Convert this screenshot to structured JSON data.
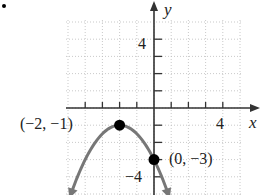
{
  "chart_data": {
    "type": "line",
    "title": "",
    "xlabel": "x",
    "ylabel": "y",
    "xlim": [
      -5,
      5
    ],
    "ylim": [
      -5,
      5
    ],
    "grid": true,
    "grid_style": "dotted",
    "tick_labels": {
      "x": [
        {
          "value": 4,
          "label": "4"
        }
      ],
      "y": [
        {
          "value": 4,
          "label": "4"
        },
        {
          "value": -4,
          "label": "−4"
        }
      ]
    },
    "series": [
      {
        "name": "parabola",
        "equation": "y = -1/2 (x + 2)^2 - 1",
        "color": "#777777",
        "x": [
          -4.8,
          -4,
          -3,
          -2,
          -1,
          0,
          0.8
        ],
        "y": [
          -4.92,
          -3,
          -1.5,
          -1,
          -1.5,
          -3,
          -4.92
        ],
        "arrows": "both"
      }
    ],
    "points": [
      {
        "x": -2,
        "y": -1,
        "label": "(−2, −1)"
      },
      {
        "x": 0,
        "y": -3,
        "label": "(0, −3)"
      }
    ]
  },
  "labels": {
    "x_axis": "x",
    "y_axis": "y",
    "tick_x4": "4",
    "tick_y4": "4",
    "tick_yneg4": "−4",
    "vertex": "(−2, −1)",
    "intercept": "(0, −3)"
  }
}
